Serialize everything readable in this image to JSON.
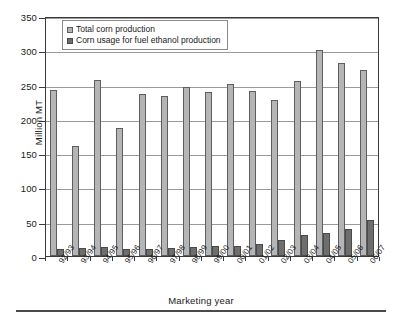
{
  "chart_data": {
    "type": "bar",
    "title": "",
    "xlabel": "Marketing year",
    "ylabel": "Million MT",
    "ylim": [
      0,
      350
    ],
    "ytick_step": 50,
    "yticks": [
      350,
      300,
      250,
      200,
      150,
      100,
      50,
      0
    ],
    "grid": "horizontal",
    "legend_position": "top-left-inside",
    "categories": [
      "92/93",
      "93/94",
      "94/95",
      "95/96",
      "96/97",
      "97/98",
      "98/99",
      "99/00",
      "00/01",
      "01/02",
      "02/03",
      "03/04",
      "04/05",
      "05/06",
      "06/07"
    ],
    "series": [
      {
        "name": "Total corn production",
        "color": "#b5b5b5",
        "values": [
          242,
          161,
          256,
          187,
          236,
          234,
          247,
          239,
          251,
          241,
          227,
          255,
          300,
          281,
          272
        ]
      },
      {
        "name": "Corn usage for fuel ethanol production",
        "color": "#6e6e6e",
        "values": [
          10,
          11,
          13,
          10,
          10,
          12,
          13,
          14,
          15,
          17,
          24,
          30,
          33,
          40,
          53
        ]
      }
    ]
  },
  "legend": {
    "items": [
      {
        "label": "Total corn production"
      },
      {
        "label": "Corn usage for fuel ethanol production"
      }
    ]
  },
  "axes": {
    "y_title": "Million MT",
    "x_title": "Marketing year"
  },
  "colors": {
    "series1": "#b5b5b5",
    "series2": "#6e6e6e",
    "axis": "#3a3a3a",
    "grid": "#9a9a9a",
    "background": "#ffffff"
  }
}
